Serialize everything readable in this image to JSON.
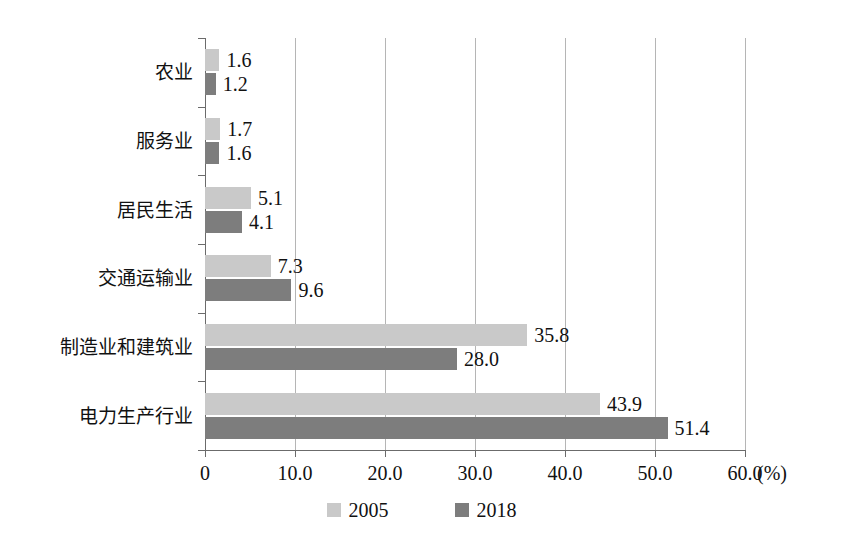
{
  "chart_data": {
    "type": "bar",
    "orientation": "horizontal",
    "title": "",
    "subtitle": "",
    "xlabel": "(%)",
    "ylabel": "",
    "xlim": [
      0,
      60
    ],
    "xticks": [
      "0",
      "10.0",
      "20.0",
      "30.0",
      "40.0",
      "50.0",
      "60.0"
    ],
    "xtick_values": [
      0,
      10,
      20,
      30,
      40,
      50,
      60
    ],
    "unit": "(%)",
    "grid": true,
    "grid_axis": "x",
    "legend_position": "bottom-center",
    "categories": [
      "农业",
      "服务业",
      "居民生活",
      "交通运输业",
      "制造业和建筑业",
      "电力生产行业"
    ],
    "series": [
      {
        "name": "2005",
        "color": "#c9c9c9",
        "values": [
          1.6,
          1.7,
          5.1,
          7.3,
          35.8,
          43.9
        ],
        "labels": [
          "1.6",
          "1.7",
          "5.1",
          "7.3",
          "35.8",
          "43.9"
        ]
      },
      {
        "name": "2018",
        "color": "#7d7d7d",
        "values": [
          1.2,
          1.6,
          4.1,
          9.6,
          28.0,
          51.4
        ],
        "labels": [
          "1.2",
          "1.6",
          "4.1",
          "9.6",
          "28.0",
          "51.4"
        ]
      }
    ],
    "legend": [
      "2005",
      "2018"
    ],
    "colors": {
      "series_2005": "#c9c9c9",
      "series_2018": "#7d7d7d",
      "gridline": "#b5b5b5",
      "axis": "#6b6b6b",
      "background": "#ffffff",
      "text": "#111111"
    }
  }
}
